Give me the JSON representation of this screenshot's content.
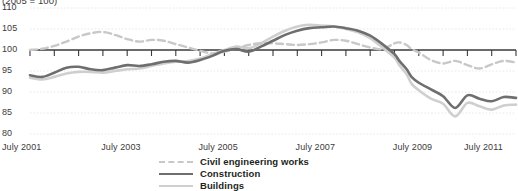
{
  "chart_data": {
    "type": "line",
    "title": "",
    "unit_note": "(2005 = 100)",
    "xlabel": "",
    "ylabel": "",
    "ylim": [
      80,
      110
    ],
    "yticks": [
      80,
      85,
      90,
      95,
      100,
      105,
      110
    ],
    "grid": true,
    "baseline_value": 100,
    "legend_position": "bottom",
    "x_start": "July 2001",
    "x_end": "July 2011",
    "xticks": [
      "July 2001",
      "July 2003",
      "July 2005",
      "July 2007",
      "July 2009",
      "July 2011"
    ],
    "xtick_x": [
      2001.5,
      2003.5,
      2005.5,
      2007.5,
      2009.5,
      2011.5
    ],
    "minor_tick_interval_months": 6,
    "x": [
      2001.5,
      2001.75,
      2002.0,
      2002.25,
      2002.5,
      2002.75,
      2003.0,
      2003.25,
      2003.5,
      2003.75,
      2004.0,
      2004.25,
      2004.5,
      2004.75,
      2005.0,
      2005.25,
      2005.5,
      2005.75,
      2006.0,
      2006.25,
      2006.5,
      2006.75,
      2007.0,
      2007.25,
      2007.5,
      2007.75,
      2008.0,
      2008.25,
      2008.5,
      2008.75,
      2009.0,
      2009.1,
      2009.25,
      2009.35,
      2009.5,
      2009.75,
      2010.0,
      2010.25,
      2010.5,
      2010.75,
      2011.0,
      2011.25,
      2011.5
    ],
    "series": [
      {
        "name": "Civil engineering works",
        "style": "dashed",
        "color": "#c8c8c8",
        "values": [
          100.0,
          100.3,
          101.0,
          102.0,
          103.2,
          104.0,
          104.3,
          103.6,
          102.6,
          102.0,
          102.4,
          102.2,
          101.4,
          100.6,
          99.8,
          99.2,
          99.6,
          100.4,
          101.2,
          101.6,
          101.6,
          101.4,
          101.2,
          101.4,
          101.8,
          102.4,
          102.2,
          101.4,
          100.6,
          100.2,
          101.6,
          101.8,
          101.2,
          100.2,
          99.4,
          97.6,
          96.8,
          97.4,
          96.4,
          95.6,
          96.6,
          97.4,
          97.0
        ]
      },
      {
        "name": "Construction",
        "style": "solid",
        "color": "#6e6e6e",
        "values": [
          94.0,
          93.6,
          94.6,
          95.8,
          96.0,
          95.4,
          95.2,
          95.8,
          96.4,
          96.2,
          96.6,
          97.2,
          97.4,
          97.0,
          97.6,
          98.6,
          99.8,
          100.2,
          99.6,
          100.8,
          102.2,
          103.6,
          104.6,
          105.2,
          105.4,
          105.6,
          105.2,
          104.6,
          103.4,
          101.4,
          99.0,
          97.4,
          95.4,
          93.6,
          92.2,
          90.6,
          89.0,
          86.2,
          89.2,
          88.4,
          87.8,
          88.8,
          88.6
        ]
      },
      {
        "name": "Buildings",
        "style": "solid",
        "color": "#cfcfcf",
        "values": [
          93.4,
          93.0,
          93.6,
          94.4,
          94.8,
          94.8,
          94.6,
          95.0,
          95.4,
          95.6,
          96.2,
          96.8,
          97.2,
          97.4,
          98.0,
          99.0,
          100.0,
          100.8,
          100.4,
          101.6,
          103.2,
          104.6,
          105.6,
          106.0,
          105.8,
          105.6,
          105.0,
          104.2,
          102.8,
          100.6,
          98.2,
          96.4,
          94.2,
          92.0,
          90.4,
          88.4,
          87.2,
          84.2,
          87.4,
          86.6,
          85.8,
          86.8,
          87.0
        ]
      }
    ]
  },
  "legend": {
    "items": [
      {
        "label": "Civil engineering works"
      },
      {
        "label": "Construction"
      },
      {
        "label": "Buildings"
      }
    ]
  }
}
